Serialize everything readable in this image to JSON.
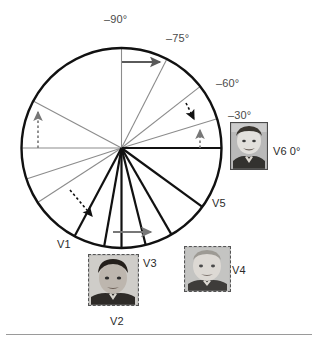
{
  "figure": {
    "circle": {
      "cx": 121.5,
      "cy": 148,
      "r": 100,
      "stroke": "#111111",
      "stroke_width": 2.4
    },
    "colors": {
      "black": "#111111",
      "gray": "#8c8c8c",
      "dark_gray": "#5a5a5a",
      "mid_gray": "#777777",
      "label": "#4a4a4a",
      "rule": "#9a9a9a"
    },
    "angle_labels": [
      {
        "text": "–90°",
        "x": 104,
        "y": 14
      },
      {
        "text": "–75°",
        "x": 166,
        "y": 33
      },
      {
        "text": "–60°",
        "x": 216,
        "y": 78
      },
      {
        "text": "–30°",
        "x": 228,
        "y": 110
      }
    ],
    "view_labels": [
      {
        "text": "V6  0°",
        "x": 273,
        "y": 146
      },
      {
        "text": "V5",
        "x": 212,
        "y": 198
      },
      {
        "text": "V1",
        "x": 57,
        "y": 239
      },
      {
        "text": "V3",
        "x": 143,
        "y": 258
      },
      {
        "text": "V4",
        "x": 232,
        "y": 265
      },
      {
        "text": "V2",
        "x": 110,
        "y": 316
      }
    ],
    "spokes": [
      {
        "name": "spoke-up-vertical",
        "angle_deg": -90,
        "color": "#8c8c8c",
        "width": 1.1,
        "inner": 0,
        "outer": 100
      },
      {
        "name": "spoke-minus75",
        "angle_deg": -63,
        "color": "#8c8c8c",
        "width": 1.1,
        "inner": 0,
        "outer": 100
      },
      {
        "name": "spoke-minus60",
        "angle_deg": -38,
        "color": "#8c8c8c",
        "width": 1.1,
        "inner": 0,
        "outer": 100
      },
      {
        "name": "spoke-minus30",
        "angle_deg": -17,
        "color": "#8c8c8c",
        "width": 1.1,
        "inner": 0,
        "outer": 100
      },
      {
        "name": "spoke-zero-right",
        "angle_deg": 0,
        "color": "#111111",
        "width": 2.0,
        "inner": 0,
        "outer": 100
      },
      {
        "name": "spoke-left-horizontal",
        "angle_deg": 180,
        "color": "#8c8c8c",
        "width": 1.1,
        "inner": 0,
        "outer": 100
      },
      {
        "name": "spoke-upper-left",
        "angle_deg": 208,
        "color": "#8c8c8c",
        "width": 1.1,
        "inner": 0,
        "outer": 100
      },
      {
        "name": "spoke-lower-left-a",
        "angle_deg": 162,
        "color": "#8c8c8c",
        "width": 1.1,
        "inner": 0,
        "outer": 100
      },
      {
        "name": "spoke-lower-left-b",
        "angle_deg": 147,
        "color": "#8c8c8c",
        "width": 1.1,
        "inner": 0,
        "outer": 100
      },
      {
        "name": "spoke-v1",
        "angle_deg": 118,
        "color": "#111111",
        "width": 2.2,
        "inner": 0,
        "outer": 100
      },
      {
        "name": "spoke-v2-left",
        "angle_deg": 100,
        "color": "#111111",
        "width": 2.2,
        "inner": 0,
        "outer": 100
      },
      {
        "name": "spoke-v2-right",
        "angle_deg": 90,
        "color": "#111111",
        "width": 2.2,
        "inner": 0,
        "outer": 100
      },
      {
        "name": "spoke-v3",
        "angle_deg": 76,
        "color": "#111111",
        "width": 2.2,
        "inner": 0,
        "outer": 100
      },
      {
        "name": "spoke-v4",
        "angle_deg": 60,
        "color": "#111111",
        "width": 2.2,
        "inner": 0,
        "outer": 100
      },
      {
        "name": "spoke-v5",
        "angle_deg": 36,
        "color": "#111111",
        "width": 2.2,
        "inner": 0,
        "outer": 100
      }
    ],
    "arrows": [
      {
        "name": "arrow-top-solid-right",
        "style": "solid",
        "color": "#5a5a5a",
        "x1": 122,
        "y1": 62,
        "x2": 160,
        "y2": 62
      },
      {
        "name": "arrow-minus60-dashed-down",
        "style": "dashed",
        "color": "#111111",
        "x1": 186,
        "y1": 103,
        "x2": 194,
        "y2": 119
      },
      {
        "name": "arrow-minus30-dashed-up",
        "style": "dashed",
        "color": "#777777",
        "x1": 200,
        "y1": 148,
        "x2": 200,
        "y2": 130
      },
      {
        "name": "arrow-left-dashed-up",
        "style": "dashed",
        "color": "#777777",
        "x1": 38,
        "y1": 148,
        "x2": 38,
        "y2": 112
      },
      {
        "name": "arrow-lower-left-dashed-down",
        "style": "dashed",
        "color": "#111111",
        "x1": 70,
        "y1": 190,
        "x2": 92,
        "y2": 216
      },
      {
        "name": "arrow-bottom-solid-right",
        "style": "solid",
        "color": "#777777",
        "x1": 113,
        "y1": 232,
        "x2": 151,
        "y2": 232
      }
    ],
    "thumbnails": [
      {
        "name": "thumbnail-v6",
        "label": "V6",
        "border": "solid",
        "x": 230,
        "y": 122,
        "w": 36,
        "h": 46,
        "tone": "light"
      },
      {
        "name": "thumbnail-v4",
        "label": "V4",
        "border": "dashed",
        "x": 184,
        "y": 246,
        "w": 45,
        "h": 44,
        "tone": "light"
      },
      {
        "name": "thumbnail-v2",
        "label": "V2",
        "border": "dashed",
        "x": 88,
        "y": 254,
        "w": 49,
        "h": 50,
        "tone": "dark"
      }
    ]
  }
}
